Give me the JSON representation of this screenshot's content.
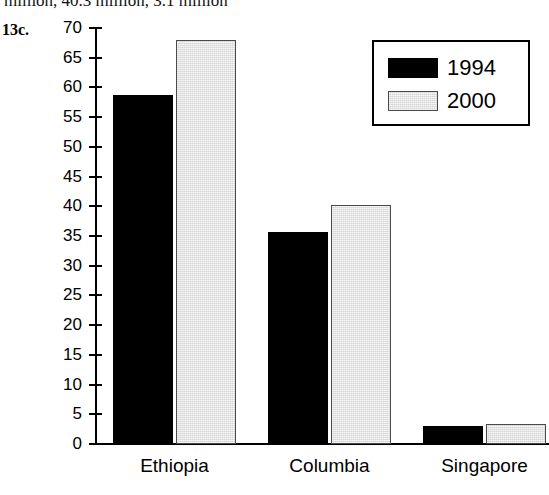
{
  "answer_text": "million, 40.3 million, 3.1 million",
  "question_number": "13c.",
  "chart_data": {
    "type": "bar",
    "title": "",
    "xlabel": "",
    "ylabel": "",
    "ylim": [
      0,
      70
    ],
    "ytick_step": 5,
    "grid": false,
    "legend_position": "top-right",
    "categories": [
      "Ethiopia",
      "Columbia",
      "Singapore"
    ],
    "ytick_labels": [
      "70",
      "65",
      "60",
      "55",
      "50",
      "45",
      "40",
      "35",
      "30",
      "25",
      "20",
      "15",
      "10",
      "5",
      "0"
    ],
    "series": [
      {
        "name": "1994",
        "color": "#000000",
        "values": [
          58.7,
          35.6,
          3.1
        ]
      },
      {
        "name": "2000",
        "color": "#d6d6d6",
        "values": [
          68.0,
          40.3,
          3.3
        ]
      }
    ]
  },
  "legend": {
    "entries": [
      {
        "label": "1994",
        "swatch": "black-swatch"
      },
      {
        "label": "2000",
        "swatch": "gray-swatch"
      }
    ]
  }
}
